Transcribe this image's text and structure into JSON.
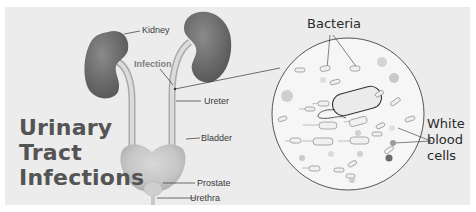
{
  "title": {
    "lines": [
      "Urinary",
      "Tract",
      "Infections"
    ]
  },
  "anatomy_labels": {
    "kidney": "Kidney",
    "infection": "Infection",
    "ureter": "Ureter",
    "bladder": "Bladder",
    "prostate": "Prostate",
    "urethra": "Urethra"
  },
  "microscope_labels": {
    "bacteria": "Bacteria",
    "white_blood_cells": [
      "White",
      "blood",
      "cells"
    ]
  },
  "colors": {
    "background": "#ececec",
    "kidney": "#6e6e6e",
    "title": "#545454",
    "bladder": "#c4c4c4"
  }
}
